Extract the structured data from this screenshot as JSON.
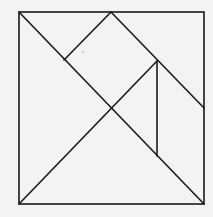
{
  "diagram": {
    "type": "tangram-square",
    "background": "#f3f3f1",
    "stroke_color": "#1a1a1a",
    "outer_square": {
      "x1": 19,
      "y1": 12,
      "x2": 204,
      "y2": 204
    },
    "segments": [
      {
        "id": "diag-main",
        "x1": 19,
        "y1": 12,
        "x2": 204,
        "y2": 204
      },
      {
        "id": "diag-anti",
        "x1": 19,
        "y1": 204,
        "x2": 157,
        "y2": 61
      },
      {
        "id": "top-apex-left",
        "x1": 64,
        "y1": 60,
        "x2": 111,
        "y2": 12
      },
      {
        "id": "top-apex-right",
        "x1": 111,
        "y1": 12,
        "x2": 204,
        "y2": 108
      },
      {
        "id": "vertical-inner",
        "x1": 157,
        "y1": 61,
        "x2": 157,
        "y2": 156
      }
    ]
  }
}
